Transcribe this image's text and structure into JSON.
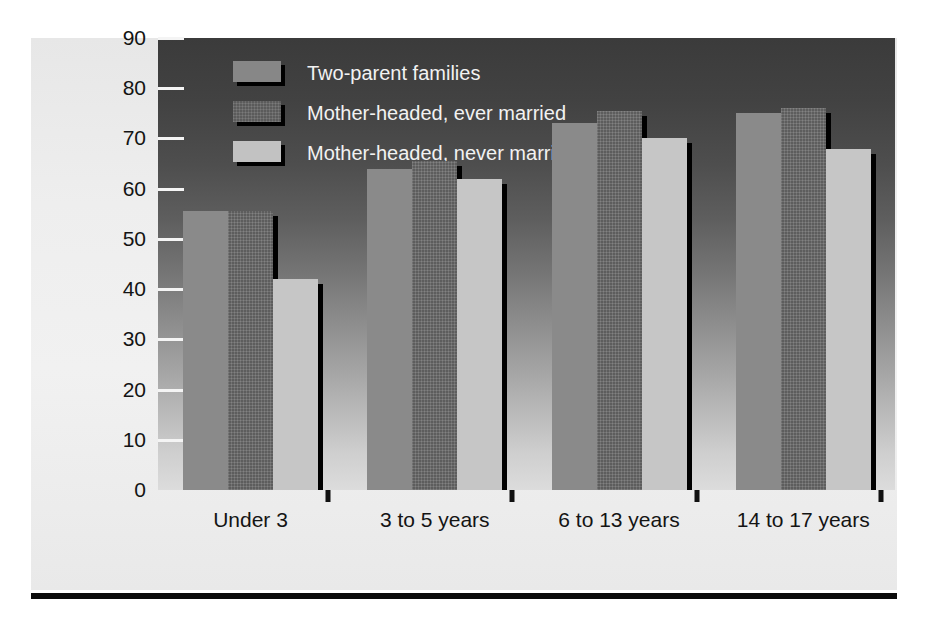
{
  "chart_data": {
    "type": "bar",
    "title": "",
    "subtitle": "",
    "xlabel": "",
    "ylabel": "Percentage of employed mothers",
    "ylim": [
      0,
      90
    ],
    "yticks": [
      0,
      10,
      20,
      30,
      40,
      50,
      60,
      70,
      80,
      90
    ],
    "grid": false,
    "legend_position": "top-left-inside",
    "categories": [
      "Under 3",
      "3 to 5 years",
      "6 to 13 years",
      "14 to 17 years"
    ],
    "series": [
      {
        "name": "Two-parent families",
        "color": "#8a8a8a",
        "values": [
          55.5,
          64,
          73,
          75
        ]
      },
      {
        "name": "Mother-headed, ever married",
        "color": "#5d5d5d",
        "values": [
          55.5,
          65.5,
          75.5,
          76
        ]
      },
      {
        "name": "Mother-headed, never married",
        "color": "#c6c6c6",
        "values": [
          42,
          62,
          70,
          68
        ]
      }
    ],
    "annotations": []
  },
  "figure": {
    "background_top": "#3b3b3b",
    "background_bottom": "#dcdcdc",
    "panel_color": "#ededed",
    "rule_color": "#0b0b0b",
    "tick_color": "#f4f4f4",
    "legend_text_color": "#f2f2f2",
    "axis_text_color": "#141414"
  }
}
